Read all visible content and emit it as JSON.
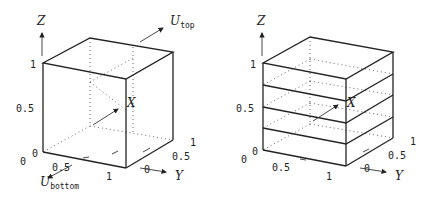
{
  "figure": {
    "panels": [
      {
        "id": "left",
        "description": "Unit cube with top and bottom boundary velocities",
        "axes": {
          "x_label": "X",
          "y_label": "Y",
          "z_label": "Z"
        },
        "z_ticks": [
          "0",
          "0.5",
          "1"
        ],
        "x_ticks": [
          "0",
          "0.5",
          "1"
        ],
        "y_ticks": [
          "0",
          "0.5",
          "1"
        ],
        "annotations": {
          "top_velocity": "U",
          "top_velocity_sub": "top",
          "bottom_velocity": "U",
          "bottom_velocity_sub": "bottom"
        }
      },
      {
        "id": "right",
        "description": "Unit cube divided into four horizontal layers",
        "axes": {
          "x_label": "X",
          "y_label": "Y",
          "z_label": "Z"
        },
        "z_ticks": [
          "0",
          "0.5",
          "1"
        ],
        "x_ticks": [
          "0",
          "0.5",
          "1"
        ],
        "y_ticks": [
          "0",
          "0.5",
          "1"
        ],
        "layers": 4
      }
    ]
  }
}
